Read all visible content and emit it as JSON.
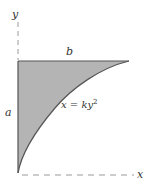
{
  "diagram": {
    "labels": {
      "y_axis": "y",
      "x_axis": "x",
      "height": "a",
      "width": "b",
      "curve_lhs": "x = ky",
      "curve_exp": "2"
    },
    "colors": {
      "fill": "#b4b4b4",
      "stroke": "#555555",
      "axis_dash": "#9a9a9a",
      "text": "#333333"
    }
  }
}
